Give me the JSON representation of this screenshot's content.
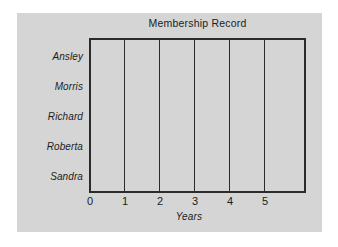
{
  "chart_data": {
    "type": "bar",
    "orientation": "horizontal",
    "title": "Membership Record",
    "xlabel": "Years",
    "ylabel": "",
    "categories": [
      "Ansley",
      "Morris",
      "Richard",
      "Roberta",
      "Sandra"
    ],
    "values": [
      null,
      null,
      null,
      null,
      null
    ],
    "series": [
      {
        "name": "",
        "values": [
          null,
          null,
          null,
          null,
          null
        ]
      }
    ],
    "xlim": [
      0,
      6.2
    ],
    "xticks": [
      0,
      1,
      2,
      3,
      4,
      5
    ],
    "xtick_labels": [
      "0",
      "1",
      "2",
      "3",
      "4",
      "5"
    ],
    "grid": "vertical",
    "legend": "none",
    "note": "blank worksheet template - no bars plotted"
  },
  "figure": {
    "title": "Membership Record",
    "x_axis_title": "Years",
    "category_labels": [
      "Ansley",
      "Morris",
      "Richard",
      "Roberta",
      "Sandra"
    ],
    "tick_labels": [
      "0",
      "1",
      "2",
      "3",
      "4",
      "5"
    ],
    "colors": {
      "panel_background": "#d5d5d5",
      "page_background": "#ffffff",
      "axis_line": "#2b2b2b",
      "text": "#1c1c1c"
    }
  }
}
